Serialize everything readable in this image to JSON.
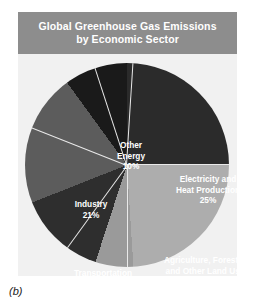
{
  "figure": {
    "caption": "(b)"
  },
  "chart_data": {
    "type": "pie",
    "title": "Global Greenhouse Gas Emissions by Economic Sector",
    "title_lines": [
      "Global Greenhouse Gas Emissions",
      "by Economic Sector"
    ],
    "units": "percent",
    "legend": "none",
    "labels_placement": "inside-slices",
    "start_angle_deg": 0,
    "direction": "clockwise",
    "categories": [
      "Electricity and Heat Production",
      "Agriculture, Forestry and Other Land Use",
      "Buildings",
      "Transportation",
      "Industry",
      "Other Energy"
    ],
    "values": [
      25,
      24,
      6,
      14,
      21,
      10
    ],
    "slices": [
      {
        "name": "Electricity and Heat Production",
        "name_lines": [
          "Electricity and",
          "Heat Production"
        ],
        "value": 25,
        "pct_label": "25%",
        "color": "#2b2b2b",
        "text_color": "#ffffff",
        "start_deg": 0,
        "end_deg": 90
      },
      {
        "name": "Agriculture, Forestry and Other Land Use",
        "name_lines": [
          "Agriculture, Forestry",
          "and Other Land Use"
        ],
        "value": 24,
        "pct_label": "24%",
        "color": "#adadad",
        "text_color": "#ffffff",
        "start_deg": 90,
        "end_deg": 176.4
      },
      {
        "name": "Buildings",
        "name_lines": [
          "Buildings"
        ],
        "value": 6,
        "pct_label": "6%",
        "color": "#9a9a9a",
        "text_color": "#ffffff",
        "start_deg": 176.4,
        "end_deg": 198
      },
      {
        "name": "Transportation",
        "name_lines": [
          "Transportation"
        ],
        "value": 14,
        "pct_label": "14%",
        "color": "#2e2e2e",
        "text_color": "#ffffff",
        "start_deg": 198,
        "end_deg": 248.4
      },
      {
        "name": "Industry",
        "name_lines": [
          "Industry"
        ],
        "value": 21,
        "pct_label": "21%",
        "color": "#5c5c5c",
        "text_color": "#ffffff",
        "start_deg": 248.4,
        "end_deg": 324
      },
      {
        "name": "Other Energy",
        "name_lines": [
          "Other",
          "Energy"
        ],
        "value": 10,
        "pct_label": "10%",
        "color": "#1a1a1a",
        "text_color": "#ffffff",
        "start_deg": 324,
        "end_deg": 360
      }
    ],
    "colors": {
      "panel_background": "#f1f1f1",
      "title_bar": "#8d8d8d",
      "title_text": "#ffffff",
      "page_background": "#ffffff"
    }
  }
}
